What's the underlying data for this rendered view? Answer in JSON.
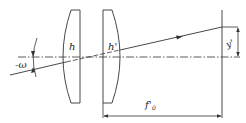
{
  "diagram": {
    "type": "optical-lens-diagram",
    "colors": {
      "line": "#333333",
      "background": "#ffffff"
    },
    "labels": {
      "field_angle": "-ω",
      "height_first": "h",
      "height_second": "h'",
      "image_height": "y'",
      "focal_length_main": "f'",
      "focal_length_sub": "0"
    }
  }
}
